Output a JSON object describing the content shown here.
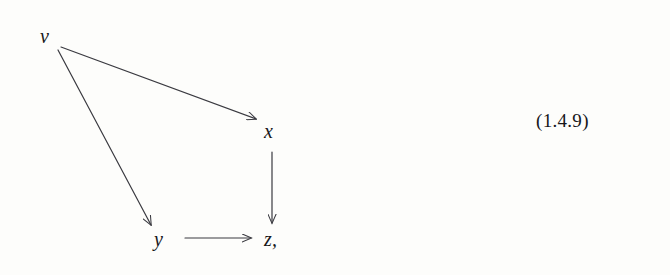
{
  "page": {
    "background_color": "#fdfdfb",
    "ink_color": "#17171a",
    "width": 670,
    "height": 275
  },
  "diagram": {
    "kind": "commutative-diagram",
    "nodes": [
      {
        "id": "v",
        "label": "v",
        "x": 47,
        "y": 37,
        "style": "math-italic"
      },
      {
        "id": "x",
        "label": "x",
        "x": 272,
        "y": 132,
        "style": "math-italic"
      },
      {
        "id": "y",
        "label": "y",
        "x": 162,
        "y": 240,
        "style": "math-italic"
      },
      {
        "id": "z",
        "label": "z,",
        "x": 272,
        "y": 240,
        "style": "math-italic"
      }
    ],
    "edges": [
      {
        "id": "v-to-x",
        "from": "v",
        "to": "x",
        "label": "",
        "x1": 61,
        "y1": 47,
        "x2": 256,
        "y2": 119,
        "arrowhead": "open"
      },
      {
        "id": "v-to-y",
        "from": "v",
        "to": "y",
        "label": "",
        "x1": 58,
        "y1": 50,
        "x2": 151,
        "y2": 225,
        "arrowhead": "open"
      },
      {
        "id": "x-to-z",
        "from": "x",
        "to": "z",
        "label": "",
        "x1": 272,
        "y1": 152,
        "x2": 272,
        "y2": 223,
        "arrowhead": "open"
      },
      {
        "id": "y-to-z",
        "from": "y",
        "to": "z",
        "label": "",
        "x1": 185,
        "y1": 238,
        "x2": 251,
        "y2": 238,
        "arrowhead": "open"
      }
    ],
    "stroke_color": "#3a3a40",
    "stroke_width": 1.2
  },
  "equation": {
    "number": "(1.4.9)"
  }
}
